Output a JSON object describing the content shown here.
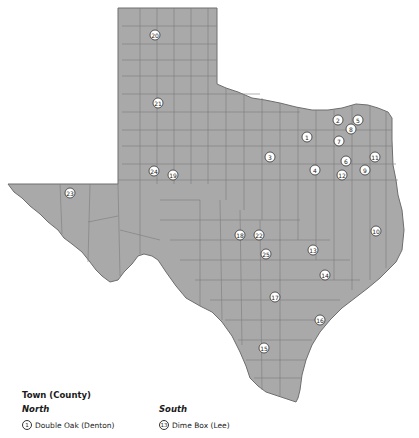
{
  "map": {
    "region": "Texas",
    "fill_color": "#a9a9a9",
    "border_color": "#6e6e6e",
    "markers": [
      {
        "id": "1",
        "x": 307,
        "y": 137
      },
      {
        "id": "2",
        "x": 338,
        "y": 120
      },
      {
        "id": "3",
        "x": 270,
        "y": 157
      },
      {
        "id": "4",
        "x": 315,
        "y": 170
      },
      {
        "id": "5",
        "x": 358,
        "y": 120
      },
      {
        "id": "6",
        "x": 346,
        "y": 161
      },
      {
        "id": "7",
        "x": 339,
        "y": 141
      },
      {
        "id": "8",
        "x": 351,
        "y": 129
      },
      {
        "id": "9",
        "x": 365,
        "y": 170
      },
      {
        "id": "10",
        "x": 376,
        "y": 231
      },
      {
        "id": "11",
        "x": 375,
        "y": 157
      },
      {
        "id": "12",
        "x": 342,
        "y": 175
      },
      {
        "id": "13",
        "x": 313,
        "y": 250
      },
      {
        "id": "14",
        "x": 325,
        "y": 275
      },
      {
        "id": "15",
        "x": 264,
        "y": 348
      },
      {
        "id": "16",
        "x": 320,
        "y": 320
      },
      {
        "id": "17",
        "x": 275,
        "y": 297
      },
      {
        "id": "18",
        "x": 240,
        "y": 235
      },
      {
        "id": "19",
        "x": 173,
        "y": 175
      },
      {
        "id": "20",
        "x": 155,
        "y": 35
      },
      {
        "id": "21",
        "x": 158,
        "y": 103
      },
      {
        "id": "22",
        "x": 259,
        "y": 235
      },
      {
        "id": "23",
        "x": 70,
        "y": 193
      },
      {
        "id": "24",
        "x": 154,
        "y": 171
      },
      {
        "id": "25",
        "x": 266,
        "y": 254
      }
    ]
  },
  "legend": {
    "title": "Town (County)",
    "north": {
      "heading": "North",
      "items": [
        {
          "num": "1",
          "label": "Double Oak (Denton)"
        }
      ]
    },
    "south": {
      "heading": "South",
      "items": [
        {
          "num": "13",
          "label": "Dime Box (Lee)"
        }
      ]
    }
  }
}
